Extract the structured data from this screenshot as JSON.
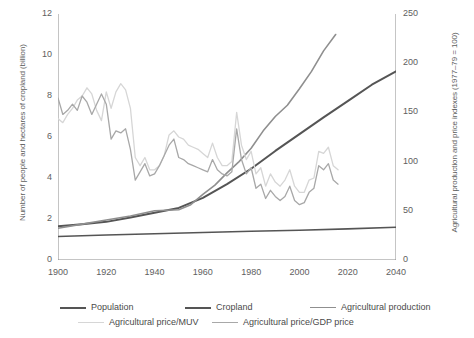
{
  "chart_data": {
    "type": "line",
    "title": "",
    "xlabel": "",
    "ylabel": "Number of people and hectares of cropland (billion)",
    "ylabel_right": "Agricultural production and price indexes (1977–79 = 100)",
    "xlim": [
      1900,
      2040
    ],
    "ylim": [
      0,
      12
    ],
    "ylim_right": [
      0,
      250
    ],
    "grid": false,
    "legend_position": "below",
    "xticks": [
      1900,
      1920,
      1940,
      1960,
      1980,
      2000,
      2020,
      2040
    ],
    "yticks_left": [
      0,
      2,
      4,
      6,
      8,
      10,
      12
    ],
    "yticks_right": [
      0,
      50,
      100,
      150,
      200,
      250
    ],
    "series": [
      {
        "name": "Population",
        "axis": "left",
        "color": "#555555",
        "width": 2.0,
        "x": [
          1900,
          1910,
          1920,
          1930,
          1940,
          1950,
          1960,
          1970,
          1980,
          1990,
          2000,
          2010,
          2020,
          2030,
          2040
        ],
        "values": [
          1.65,
          1.75,
          1.86,
          2.07,
          2.3,
          2.54,
          3.03,
          3.7,
          4.45,
          5.32,
          6.14,
          6.96,
          7.75,
          8.55,
          9.2
        ]
      },
      {
        "name": "Cropland",
        "axis": "left",
        "color": "#555555",
        "width": 1.6,
        "x": [
          1900,
          1920,
          1940,
          1960,
          1980,
          2000,
          2020,
          2040
        ],
        "values": [
          1.15,
          1.22,
          1.28,
          1.34,
          1.4,
          1.45,
          1.52,
          1.6
        ]
      },
      {
        "name": "Agricultural production",
        "axis": "left",
        "color": "#8f8f8f",
        "width": 1.6,
        "x": [
          1900,
          1910,
          1920,
          1930,
          1940,
          1950,
          1955,
          1960,
          1965,
          1970,
          1975,
          1980,
          1985,
          1990,
          1995,
          2000,
          2005,
          2010,
          2015
        ],
        "values": [
          1.55,
          1.75,
          1.95,
          2.15,
          2.4,
          2.45,
          2.7,
          3.2,
          3.65,
          4.25,
          4.8,
          5.45,
          6.3,
          7.0,
          7.55,
          8.35,
          9.2,
          10.2,
          11.0
        ]
      },
      {
        "name": "Agricultural price/MUV",
        "axis": "left",
        "color": "#d6d6d6",
        "width": 1.3,
        "x": [
          1900,
          1902,
          1904,
          1906,
          1908,
          1910,
          1912,
          1914,
          1916,
          1918,
          1920,
          1922,
          1924,
          1926,
          1928,
          1930,
          1932,
          1934,
          1936,
          1938,
          1940,
          1942,
          1944,
          1946,
          1948,
          1950,
          1952,
          1954,
          1956,
          1958,
          1960,
          1962,
          1964,
          1966,
          1968,
          1970,
          1972,
          1974,
          1976,
          1978,
          1980,
          1982,
          1984,
          1986,
          1988,
          1990,
          1992,
          1994,
          1996,
          1998,
          2000,
          2002,
          2004,
          2006,
          2008,
          2010,
          2012,
          2014,
          2016
        ],
        "values": [
          6.9,
          6.7,
          7.1,
          7.4,
          7.8,
          8.0,
          8.4,
          8.1,
          7.3,
          6.8,
          8.2,
          7.4,
          8.2,
          8.6,
          8.3,
          7.4,
          5.0,
          4.6,
          5.0,
          4.4,
          4.4,
          4.6,
          5.1,
          6.1,
          6.3,
          6.0,
          5.9,
          5.6,
          5.5,
          5.4,
          5.2,
          5.0,
          5.7,
          5.0,
          4.6,
          4.6,
          4.8,
          7.2,
          5.6,
          4.9,
          5.3,
          4.2,
          4.5,
          3.6,
          4.2,
          3.8,
          3.6,
          3.9,
          4.4,
          3.6,
          3.3,
          3.3,
          3.9,
          4.0,
          5.3,
          5.2,
          5.5,
          4.6,
          4.4
        ]
      },
      {
        "name": "Agricultural price/GDP price",
        "axis": "left",
        "color": "#a8a8a8",
        "width": 1.3,
        "x": [
          1900,
          1902,
          1904,
          1906,
          1908,
          1910,
          1912,
          1914,
          1916,
          1918,
          1920,
          1922,
          1924,
          1926,
          1928,
          1930,
          1932,
          1934,
          1936,
          1938,
          1940,
          1942,
          1944,
          1946,
          1948,
          1950,
          1952,
          1954,
          1956,
          1958,
          1960,
          1962,
          1964,
          1966,
          1968,
          1970,
          1972,
          1974,
          1976,
          1978,
          1980,
          1982,
          1984,
          1986,
          1988,
          1990,
          1992,
          1994,
          1996,
          1998,
          2000,
          2002,
          2004,
          2006,
          2008,
          2010,
          2012,
          2014,
          2016
        ],
        "values": [
          7.9,
          7.1,
          7.3,
          7.6,
          7.3,
          8.0,
          7.7,
          7.1,
          7.6,
          8.1,
          7.6,
          5.9,
          6.3,
          6.2,
          6.4,
          5.4,
          3.9,
          4.3,
          4.7,
          4.1,
          4.2,
          4.6,
          5.1,
          5.6,
          5.9,
          5.0,
          4.9,
          4.7,
          4.6,
          4.5,
          4.4,
          4.3,
          4.9,
          4.4,
          4.2,
          4.1,
          4.3,
          6.4,
          4.9,
          4.2,
          4.5,
          3.5,
          3.7,
          3.0,
          3.4,
          3.1,
          2.9,
          3.1,
          3.6,
          2.9,
          2.7,
          2.8,
          3.3,
          3.5,
          4.6,
          4.4,
          4.7,
          3.9,
          3.7
        ]
      }
    ]
  },
  "legend": {
    "items": [
      {
        "label": "Population",
        "color": "#555555",
        "width": 2.0
      },
      {
        "label": "Cropland",
        "color": "#555555",
        "width": 2.0
      },
      {
        "label": "Agricultural production",
        "color": "#8f8f8f",
        "width": 1.6
      },
      {
        "label": "Agricultural price/MUV",
        "color": "#d6d6d6",
        "width": 1.6
      },
      {
        "label": "Agricultural price/GDP price",
        "color": "#a8a8a8",
        "width": 1.6
      }
    ]
  },
  "axes": {
    "left_title": "Number of people and hectares of cropland (billion)",
    "right_title": "Agricultural production and price indexes (1977–79 = 100)"
  }
}
